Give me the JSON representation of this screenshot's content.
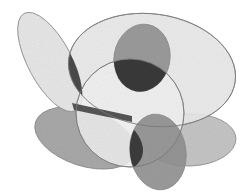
{
  "image": {
    "description": "Abstract pencil-shaded drawing of overlapping ellipses and a circle with darker shading in intersection regions",
    "background": "#ffffff",
    "stroke": "#8a8a8a",
    "shapes": [
      {
        "name": "left-tall-ellipse",
        "cx": 50,
        "cy": 62,
        "rx": 22,
        "ry": 55,
        "rotate": -28,
        "fill": "#e6e6e6"
      },
      {
        "name": "top-wide-ellipse",
        "cx": 152,
        "cy": 70,
        "rx": 84,
        "ry": 56,
        "rotate": 8,
        "fill": "#e8e8e8"
      },
      {
        "name": "top-blob",
        "cx": 142,
        "cy": 58,
        "rx": 28,
        "ry": 34,
        "rotate": 10,
        "fill": "#9a9a9a"
      },
      {
        "name": "center-circle",
        "cx": 130,
        "cy": 113,
        "rx": 54,
        "ry": 54,
        "rotate": 0,
        "fill": "#f0f0f0"
      },
      {
        "name": "bottom-left-ellipse",
        "cx": 85,
        "cy": 138,
        "rx": 52,
        "ry": 28,
        "rotate": 18,
        "fill": "#a8a8a8"
      },
      {
        "name": "bottom-right-ellipse",
        "cx": 190,
        "cy": 140,
        "rx": 46,
        "ry": 26,
        "rotate": -2,
        "fill": "#c4c4c4"
      },
      {
        "name": "bottom-center-ellipse",
        "cx": 158,
        "cy": 152,
        "rx": 28,
        "ry": 38,
        "rotate": -8,
        "fill": "#8f8f8f"
      }
    ],
    "dark_regions": [
      {
        "name": "left-lens",
        "fill": "#4a4a4a"
      },
      {
        "name": "top-lens",
        "fill": "#3a3a3a"
      },
      {
        "name": "bottom-lens",
        "fill": "#3c3c3c"
      },
      {
        "name": "bar",
        "fill": "#555555"
      }
    ]
  }
}
